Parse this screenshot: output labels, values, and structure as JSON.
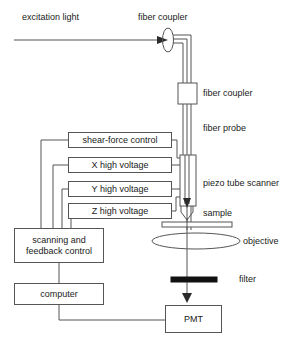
{
  "figure": {
    "kind": "near-field-scanning-optical-microscope-schematic"
  },
  "labels": {
    "excitation_light": "excitation light",
    "fiber_coupler_top": "fiber coupler",
    "fiber_coupler_right": "fiber coupler",
    "fiber_probe": "fiber probe",
    "piezo_tube_scanner": "piezo tube scanner",
    "sample": "sample",
    "objective": "objective",
    "filter": "filter"
  },
  "boxes": {
    "shear_force_control": "shear-force control",
    "x_high_voltage": "X high voltage",
    "y_high_voltage": "Y high voltage",
    "z_high_voltage": "Z high voltage",
    "scanning_feedback_control_line1": "scanning and",
    "scanning_feedback_control_line2": "feedback control",
    "computer": "computer",
    "pmt": "PMT"
  },
  "colors": {
    "stroke": "#555555",
    "text": "#1a1a1a",
    "background": "#ffffff",
    "filter_bar": "#111111"
  }
}
